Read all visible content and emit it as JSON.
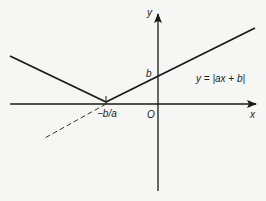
{
  "diagram": {
    "type": "function-graph",
    "function_label": "y = |ax + b|",
    "axes": {
      "x_label": "x",
      "y_label": "y",
      "origin_label": "O"
    },
    "points": {
      "y_intercept_label": "b",
      "x_intercept_label": "−b/a"
    },
    "colors": {
      "line": "#1a1a1a",
      "background": "#f6f6f4"
    }
  }
}
